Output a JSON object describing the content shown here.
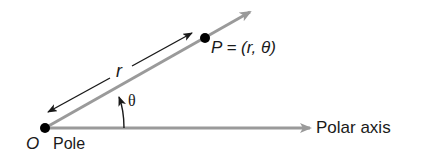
{
  "diagram": {
    "labels": {
      "origin": "O",
      "pole": "Pole",
      "point": "P = (r, θ)",
      "radius": "r",
      "angle": "θ",
      "polar_axis": "Polar axis"
    },
    "colors": {
      "ray": "#9a9a9a",
      "axis": "#9a9a9a",
      "arrow": "#1a1a1a",
      "point": "#000000",
      "text": "#1a1a1a"
    }
  }
}
